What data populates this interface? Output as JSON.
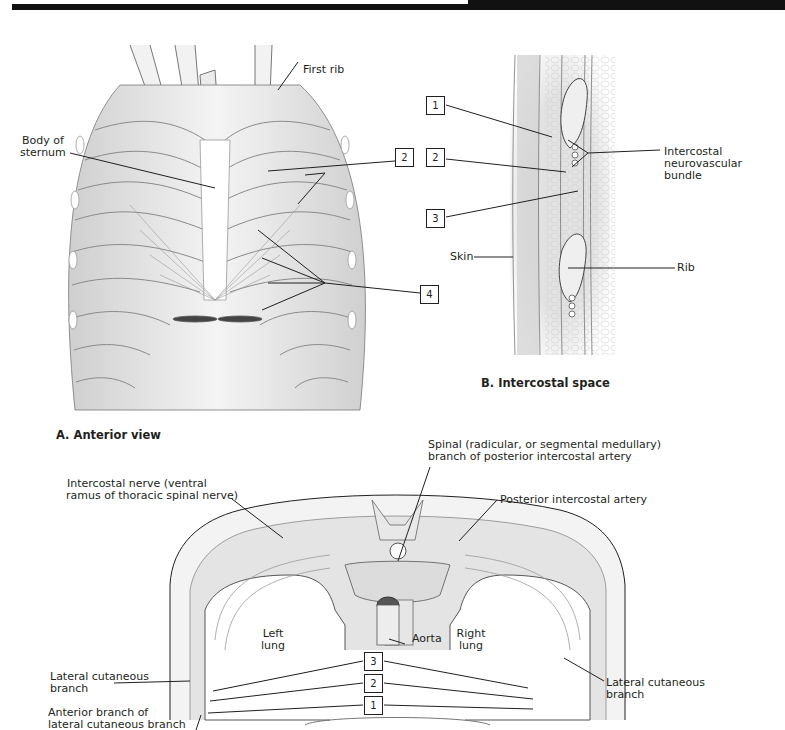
{
  "figure": {
    "panel_a": {
      "caption": "A. Anterior view",
      "labels": {
        "first_rib": "First rib",
        "body_of_sternum_1": "Body of",
        "body_of_sternum_2": "sternum"
      },
      "callouts": [
        "2",
        "4"
      ]
    },
    "panel_b": {
      "caption": "B. Intercostal space",
      "labels": {
        "neurovascular_1": "Intercostal",
        "neurovascular_2": "neurovascular",
        "neurovascular_3": "bundle",
        "skin": "Skin",
        "rib": "Rib"
      },
      "callouts": [
        "1",
        "2",
        "3",
        "4"
      ]
    },
    "panel_c": {
      "labels": {
        "spinal_branch_1": "Spinal (radicular, or segmental medullary)",
        "spinal_branch_2": "branch of posterior intercostal artery",
        "intercostal_nerve_1": "Intercostal nerve (ventral",
        "intercostal_nerve_2": "ramus of thoracic spinal nerve)",
        "posterior_intercostal_artery": "Posterior intercostal artery",
        "left_lung_1": "Left",
        "left_lung_2": "lung",
        "right_lung_1": "Right",
        "right_lung_2": "lung",
        "aorta": "Aorta",
        "lateral_cutaneous_left_1": "Lateral cutaneous",
        "lateral_cutaneous_left_2": "branch",
        "anterior_branch_1": "Anterior branch of",
        "anterior_branch_2": "lateral cutaneous branch",
        "lateral_cutaneous_right_1": "Lateral cutaneous",
        "lateral_cutaneous_right_2": "branch"
      },
      "callouts": [
        "3",
        "2",
        "1"
      ]
    },
    "colors": {
      "line": "#231f20",
      "tissue": "#e6e6e6",
      "shade": "#cfcfcf",
      "background": "#ffffff"
    }
  }
}
